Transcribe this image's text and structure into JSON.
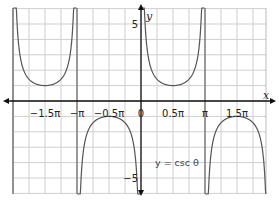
{
  "chart_data": {
    "type": "line",
    "title": "",
    "function": "y = csc θ",
    "annotation": "y = csc θ",
    "xlabel": "x",
    "ylabel": "y",
    "xlim": [
      -2.0,
      1.95
    ],
    "ylim": [
      -6,
      6
    ],
    "x_unit": "π",
    "x_ticks": [
      -1.5,
      -1,
      -0.5,
      0,
      0.5,
      1,
      1.5
    ],
    "x_tick_labels": [
      "−1.5π",
      "−π",
      "−0.5π",
      "0",
      "0.5π",
      "π",
      "1.5π"
    ],
    "y_ticks": [
      5,
      -5
    ],
    "y_tick_labels": [
      "5",
      "−5"
    ],
    "grid": true,
    "grid_x_step": 0.25,
    "grid_y_step": 1,
    "asymptotes_pi": [
      -2,
      -1,
      0,
      1
    ],
    "series": [
      {
        "name": "csc θ branch (-2π,-π)",
        "x_pi": [
          -1.95,
          -1.75,
          -1.5,
          -1.25,
          -1.05
        ],
        "values": [
          6.4,
          1.41,
          1.0,
          1.41,
          6.4
        ]
      },
      {
        "name": "csc θ branch (-π,0)",
        "x_pi": [
          -0.95,
          -0.75,
          -0.5,
          -0.25,
          -0.05
        ],
        "values": [
          -6.4,
          -1.41,
          -1.0,
          -1.41,
          -6.4
        ]
      },
      {
        "name": "csc θ branch (0,π)",
        "x_pi": [
          0.05,
          0.25,
          0.5,
          0.75,
          0.95
        ],
        "values": [
          6.4,
          1.41,
          1.0,
          1.41,
          6.4
        ]
      },
      {
        "name": "csc θ branch (π,2π)",
        "x_pi": [
          1.05,
          1.25,
          1.5,
          1.75,
          1.95
        ],
        "values": [
          -6.4,
          -1.41,
          -1.0,
          -1.41,
          -6.4
        ]
      }
    ],
    "colors": {
      "curve": "#555555",
      "grid": "#cfcfcf",
      "axis": "#111111"
    }
  }
}
